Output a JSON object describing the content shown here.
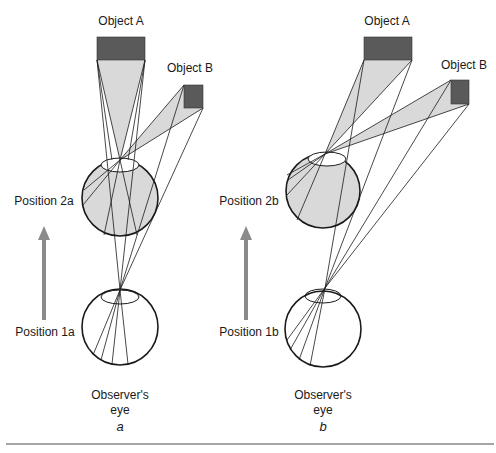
{
  "panels": [
    {
      "id": "a",
      "caption": "a",
      "object_a_label": "Object A",
      "object_b_label": "Object B",
      "upper_position_label": "Position 2a",
      "lower_position_label": "Position 1a",
      "observer_label_line1": "Observer's",
      "observer_label_line2": "eye"
    },
    {
      "id": "b",
      "caption": "b",
      "object_a_label": "Object A",
      "object_b_label": "Object B",
      "upper_position_label": "Position 2b",
      "lower_position_label": "Position 1b",
      "observer_label_line1": "Observer's",
      "observer_label_line2": "eye"
    }
  ],
  "colors": {
    "object_fill": "#5a5a5a",
    "ray_fill": "#d9d9d9",
    "eye_fill": "#d9d9d9",
    "arrow": "#8a8a8a",
    "line": "#1a1a1a",
    "rule": "#888888"
  }
}
